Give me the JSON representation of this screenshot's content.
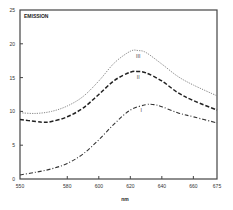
{
  "chart_data": {
    "type": "line",
    "title": "",
    "ylabel": "EMISSION",
    "xlabel": "nm",
    "xlim": [
      550,
      675
    ],
    "ylim": [
      0,
      25
    ],
    "grid": false,
    "x_ticks": [
      550,
      580,
      600,
      620,
      640,
      660,
      675
    ],
    "y_ticks": [
      0,
      5,
      10,
      15,
      20,
      25
    ],
    "series": [
      {
        "name": "III",
        "style": "dotted",
        "x": [
          550,
          560,
          570,
          580,
          590,
          600,
          610,
          620,
          625,
          630,
          640,
          650,
          660,
          675
        ],
        "values": [
          9.8,
          9.7,
          10.0,
          10.8,
          12.2,
          14.5,
          17.2,
          18.9,
          19.0,
          18.7,
          17.0,
          15.2,
          13.9,
          12.3
        ]
      },
      {
        "name": "II",
        "style": "dashed",
        "x": [
          550,
          560,
          565,
          570,
          580,
          590,
          600,
          610,
          620,
          625,
          630,
          640,
          650,
          660,
          675
        ],
        "values": [
          8.8,
          8.5,
          8.4,
          8.5,
          9.2,
          10.5,
          12.5,
          14.6,
          15.8,
          15.9,
          15.7,
          14.5,
          12.8,
          11.6,
          10.2
        ]
      },
      {
        "name": "I",
        "style": "dash-dot",
        "x": [
          550,
          560,
          570,
          580,
          590,
          600,
          610,
          620,
          630,
          635,
          640,
          650,
          660,
          675
        ],
        "values": [
          0.6,
          1.0,
          1.5,
          2.3,
          3.7,
          5.8,
          8.2,
          10.2,
          11.0,
          11.0,
          10.7,
          9.8,
          9.2,
          8.3
        ]
      }
    ],
    "annotations": [
      "III",
      "II",
      "I"
    ]
  }
}
